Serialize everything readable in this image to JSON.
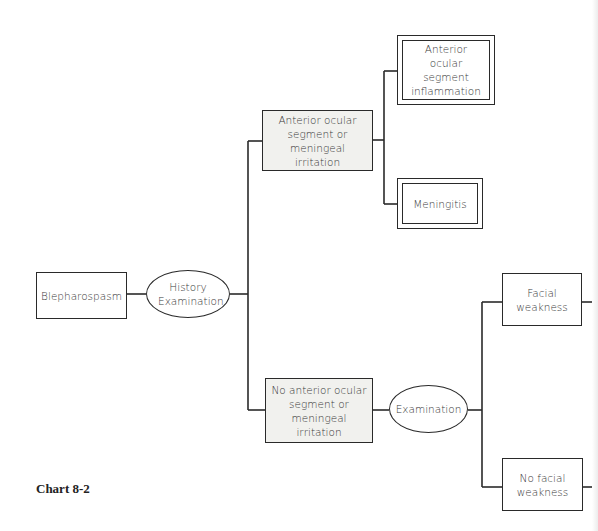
{
  "diagram": {
    "nodes": {
      "root": {
        "label": "Blepharospasm"
      },
      "history_exam": {
        "label": "History Examination"
      },
      "ant_irritation": {
        "label": "Anterior ocular segment or meningeal irritation"
      },
      "ant_inflammation": {
        "label": "Anterior ocular segment inflammation"
      },
      "meningitis": {
        "label": "Meningitis"
      },
      "no_irritation": {
        "label": "No anterior ocular segment or meningeal irritation"
      },
      "examination": {
        "label": "Examination"
      },
      "facial_weakness": {
        "label": "Facial weakness"
      },
      "no_facial_weakness": {
        "label": "No facial weakness"
      }
    },
    "edges": [
      [
        "root",
        "history_exam"
      ],
      [
        "history_exam",
        "ant_irritation"
      ],
      [
        "history_exam",
        "no_irritation"
      ],
      [
        "ant_irritation",
        "ant_inflammation"
      ],
      [
        "ant_irritation",
        "meningitis"
      ],
      [
        "no_irritation",
        "examination"
      ],
      [
        "examination",
        "facial_weakness"
      ],
      [
        "examination",
        "no_facial_weakness"
      ]
    ],
    "caption": "Chart 8-2"
  }
}
